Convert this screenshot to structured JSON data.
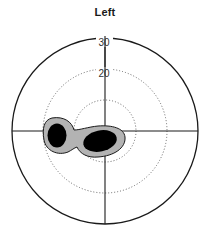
{
  "title": "Left",
  "visual_field": {
    "eye": "Left",
    "rings": [
      {
        "label": "",
        "value": 10,
        "style": "dotted"
      },
      {
        "label": "20",
        "value": 20,
        "style": "dotted"
      },
      {
        "label": "30",
        "value": 30,
        "style": "solid"
      }
    ],
    "axes": [
      "horizontal-meridian",
      "vertical-meridian"
    ],
    "scotoma": {
      "description": "Centrocecal scotoma: dense black cores with grey relative-defect border, extending from fixation toward the temporal (left) field",
      "dense_color": "#000000",
      "relative_color": "#b3b3b3"
    }
  },
  "colors": {
    "line": "#1a1a1a",
    "dotted": "#555555",
    "dense": "#000000",
    "relative": "#b3b3b3"
  }
}
